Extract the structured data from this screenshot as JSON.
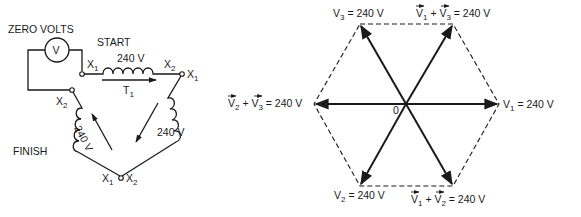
{
  "circuit": {
    "voltmeter_label": "ZERO VOLTS",
    "voltmeter_symbol": "V",
    "start_label": "START",
    "finish_label": "FINISH",
    "coil_top_voltage": "240 V",
    "coil_right_voltage": "240 V",
    "coil_left_voltage": "240 V",
    "transformer_label": "T",
    "transformer_sub": "1",
    "terminals": {
      "top_left": {
        "main": "X",
        "sub": "1"
      },
      "top_coil_end": {
        "main": "X",
        "sub": "2"
      },
      "top_right": {
        "main": "X",
        "sub": "1"
      },
      "left_mid": {
        "main": "X",
        "sub": "2"
      },
      "bottom_left": {
        "main": "X",
        "sub": "1"
      },
      "bottom_right": {
        "main": "X",
        "sub": "2"
      }
    }
  },
  "phasor": {
    "origin_label": "0",
    "labels": {
      "v1": {
        "text": "V",
        "sub": "1",
        "value": " = 240 V"
      },
      "v2": {
        "text": "V",
        "sub": "2",
        "value": " = 240 V"
      },
      "v3": {
        "text": "V",
        "sub": "3",
        "value": " = 240 V"
      },
      "v1v3": {
        "a": "V",
        "asub": "1",
        "plus": " + ",
        "b": "V",
        "bsub": "3",
        "value": " = 240 V"
      },
      "v1v2": {
        "a": "V",
        "asub": "1",
        "plus": " + ",
        "b": "V",
        "bsub": "2",
        "value": " = 240 V"
      },
      "v2v3": {
        "a": "V",
        "asub": "2",
        "plus": " + ",
        "b": "V",
        "bsub": "3",
        "value": " = 240 V"
      }
    }
  }
}
